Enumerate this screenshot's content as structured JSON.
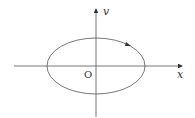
{
  "diagram": {
    "type": "phase-portrait",
    "axes": {
      "x_label": "x",
      "y_label": "v",
      "origin_label": "O"
    },
    "curve": {
      "shape": "ellipse",
      "direction": "clockwise",
      "center": [
        0,
        0
      ]
    },
    "colors": {
      "line": "#555555",
      "background": "#ffffff"
    }
  }
}
